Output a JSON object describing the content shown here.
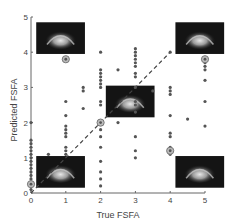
{
  "chart_data": {
    "type": "scatter",
    "title": "",
    "xlabel": "True FSFA",
    "ylabel": "Predicted FSFA",
    "xlim": [
      0,
      5
    ],
    "ylim": [
      0,
      5
    ],
    "xticks": [
      0,
      1,
      2,
      3,
      4,
      5
    ],
    "yticks": [
      0,
      1,
      2,
      3,
      4,
      5
    ],
    "grid": false,
    "legend": null,
    "series": [
      {
        "name": "predictions",
        "color": "#555555",
        "points": [
          [
            0,
            0.1
          ],
          [
            0,
            0.3
          ],
          [
            0,
            0.4
          ],
          [
            0,
            0.5
          ],
          [
            0,
            0.6
          ],
          [
            0,
            0.7
          ],
          [
            0,
            0.8
          ],
          [
            0,
            0.9
          ],
          [
            0,
            1.0
          ],
          [
            0,
            1.1
          ],
          [
            0,
            1.2
          ],
          [
            0,
            1.3
          ],
          [
            0,
            1.4
          ],
          [
            0,
            1.5
          ],
          [
            0,
            2.0
          ],
          [
            0.5,
            1.1
          ],
          [
            1,
            1.1
          ],
          [
            1,
            1.2
          ],
          [
            1,
            1.3
          ],
          [
            1,
            1.6
          ],
          [
            1,
            1.7
          ],
          [
            1,
            1.8
          ],
          [
            1,
            1.9
          ],
          [
            1,
            2.2
          ],
          [
            1,
            2.6
          ],
          [
            1,
            3.8
          ],
          [
            1.5,
            2.4
          ],
          [
            1.5,
            2.9
          ],
          [
            1.5,
            3.0
          ],
          [
            2,
            0.2
          ],
          [
            2,
            0.4
          ],
          [
            2,
            0.6
          ],
          [
            2,
            0.9
          ],
          [
            2,
            1.3
          ],
          [
            2,
            1.6
          ],
          [
            2,
            1.8
          ],
          [
            2,
            2.5
          ],
          [
            2,
            2.6
          ],
          [
            2,
            3.0
          ],
          [
            2,
            3.1
          ],
          [
            2,
            3.2
          ],
          [
            2,
            3.3
          ],
          [
            2,
            3.4
          ],
          [
            2,
            3.5
          ],
          [
            2,
            4.0
          ],
          [
            2.5,
            2.0
          ],
          [
            2.5,
            3.5
          ],
          [
            3,
            1.0
          ],
          [
            3,
            1.2
          ],
          [
            3,
            1.6
          ],
          [
            3,
            2.3
          ],
          [
            3,
            2.5
          ],
          [
            3,
            2.6
          ],
          [
            3,
            3.0
          ],
          [
            3,
            3.3
          ],
          [
            3,
            3.4
          ],
          [
            3,
            3.6
          ],
          [
            3,
            3.7
          ],
          [
            3,
            3.8
          ],
          [
            3,
            3.9
          ],
          [
            3,
            4.0
          ],
          [
            3,
            4.1
          ],
          [
            3.5,
            2.9
          ],
          [
            4,
            1.1
          ],
          [
            4,
            1.2
          ],
          [
            4,
            1.3
          ],
          [
            4,
            1.6
          ],
          [
            4,
            1.7
          ],
          [
            4,
            2.2
          ],
          [
            4,
            2.8
          ],
          [
            4,
            2.9
          ],
          [
            4,
            3.0
          ],
          [
            4,
            4.0
          ],
          [
            4.5,
            2.1
          ],
          [
            5,
            1.9
          ],
          [
            5,
            2.6
          ],
          [
            5,
            3.2
          ],
          [
            5,
            3.5
          ],
          [
            5,
            3.6
          ],
          [
            5,
            3.7
          ]
        ]
      },
      {
        "name": "mean (circled)",
        "color": "#777777",
        "points": [
          [
            0,
            0.25
          ],
          [
            1,
            3.8
          ],
          [
            2,
            2.0
          ],
          [
            4,
            1.2
          ],
          [
            5,
            3.8
          ]
        ]
      }
    ],
    "reference_line": {
      "style": "dashed",
      "points": [
        [
          0,
          0
        ],
        [
          4,
          4
        ]
      ]
    },
    "inset_images": [
      {
        "label": "image-fsfa-0",
        "x_range": [
          0.15,
          1.55
        ],
        "y_range": [
          0.15,
          1.05
        ]
      },
      {
        "label": "image-fsfa-1",
        "x_range": [
          0.15,
          1.55
        ],
        "y_range": [
          3.95,
          4.85
        ]
      },
      {
        "label": "image-fsfa-2",
        "x_range": [
          2.15,
          3.55
        ],
        "y_range": [
          2.15,
          3.05
        ]
      },
      {
        "label": "image-fsfa-4-low",
        "x_range": [
          4.15,
          5.55
        ],
        "y_range": [
          0.15,
          1.05
        ]
      },
      {
        "label": "image-fsfa-4-high",
        "x_range": [
          4.15,
          5.55
        ],
        "y_range": [
          3.95,
          4.85
        ]
      }
    ]
  }
}
